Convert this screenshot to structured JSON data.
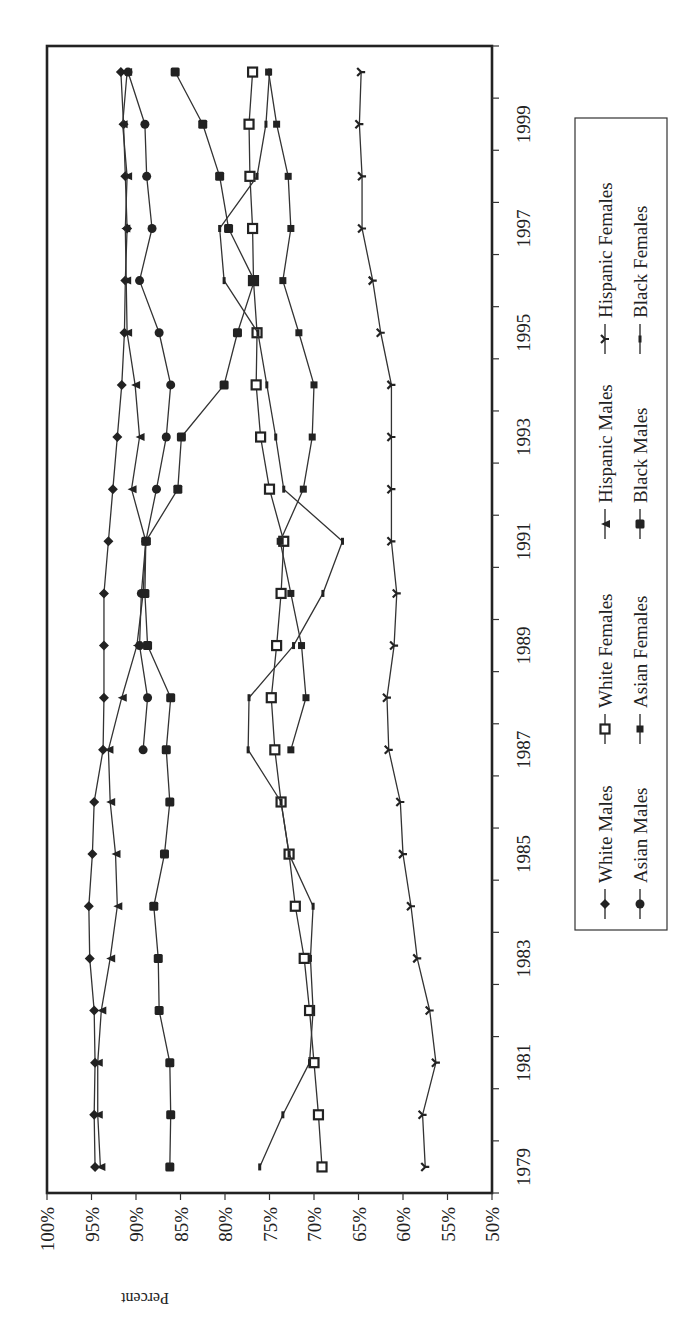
{
  "chart_data": {
    "type": "line",
    "orientation": "rotated-90-clockwise",
    "title": "",
    "xlabel": "",
    "ylabel": "Percent",
    "ylim": [
      50,
      100
    ],
    "y_ticks": [
      "100%",
      "95%",
      "90%",
      "85%",
      "80%",
      "75%",
      "70%",
      "65%",
      "60%",
      "55%",
      "50%"
    ],
    "x_tick_labels": [
      "1979",
      "1981",
      "1983",
      "1985",
      "1987",
      "1989",
      "1991",
      "1993",
      "1995",
      "1997",
      "1999"
    ],
    "categories": [
      "1979",
      "1980",
      "1981",
      "1982",
      "1983",
      "1984",
      "1985",
      "1986",
      "1987",
      "1988",
      "1989",
      "1990",
      "1991",
      "1992",
      "1993",
      "1994",
      "1995",
      "1996",
      "1997",
      "1998",
      "1999",
      "2000"
    ],
    "grid": false,
    "legend_position": "right (below plot when rotated back)",
    "series": [
      {
        "name": "White Males",
        "marker": "diamond",
        "values": [
          94.6,
          94.7,
          94.6,
          94.7,
          95.2,
          95.3,
          94.9,
          94.7,
          93.7,
          93.6,
          93.6,
          93.6,
          93.1,
          92.6,
          92.1,
          91.6,
          91.3,
          91.2,
          91.0,
          91.2,
          91.4,
          91.7
        ]
      },
      {
        "name": "White Females",
        "marker": "open-square",
        "values": [
          69.1,
          69.5,
          70.0,
          70.5,
          71.1,
          72.1,
          72.8,
          73.7,
          74.4,
          74.8,
          74.2,
          73.7,
          73.4,
          75.0,
          76.0,
          76.5,
          76.4,
          76.8,
          76.9,
          77.2,
          77.3,
          76.9
        ]
      },
      {
        "name": "Hispanic Males",
        "marker": "filled-triangle",
        "values": [
          94.0,
          94.3,
          94.3,
          93.9,
          92.9,
          92.1,
          92.3,
          92.9,
          93.1,
          91.6,
          89.9,
          89.2,
          88.9,
          90.5,
          89.6,
          90.1,
          91.0,
          91.1,
          91.2,
          91.0,
          91.5,
          91.0
        ]
      },
      {
        "name": "Hispanic Females",
        "marker": "cross-arrow",
        "values": [
          57.5,
          57.8,
          56.3,
          57.0,
          58.4,
          59.1,
          60.0,
          60.3,
          61.6,
          61.8,
          61.0,
          60.7,
          61.3,
          61.3,
          61.3,
          61.3,
          62.5,
          63.4,
          64.6,
          64.6,
          64.9,
          64.7
        ]
      },
      {
        "name": "Asian Males",
        "marker": "filled-circle",
        "values": [
          null,
          null,
          null,
          null,
          null,
          null,
          null,
          null,
          89.2,
          88.7,
          89.6,
          89.4,
          88.9,
          87.7,
          86.6,
          86.1,
          87.4,
          89.6,
          88.2,
          88.8,
          89.0,
          90.9
        ]
      },
      {
        "name": "Asian Females",
        "marker": "small-square",
        "values": [
          null,
          null,
          null,
          null,
          null,
          null,
          null,
          null,
          72.6,
          70.9,
          71.4,
          72.6,
          73.8,
          71.2,
          70.2,
          70.0,
          71.7,
          73.5,
          72.6,
          72.9,
          74.2,
          75.1
        ]
      },
      {
        "name": "Black Males",
        "marker": "filled-square",
        "values": [
          86.2,
          86.1,
          86.2,
          87.4,
          87.5,
          88.0,
          86.8,
          86.2,
          86.6,
          86.1,
          88.7,
          89.0,
          88.9,
          85.3,
          84.9,
          80.1,
          78.6,
          76.7,
          79.6,
          80.6,
          82.5,
          85.6
        ]
      },
      {
        "name": "Black Females",
        "marker": "small-tick",
        "values": [
          76.1,
          73.5,
          70.5,
          70.1,
          70.4,
          70.1,
          72.8,
          73.7,
          77.4,
          77.3,
          72.3,
          69.0,
          66.8,
          73.4,
          74.3,
          75.3,
          76.3,
          80.1,
          80.6,
          76.4,
          75.4,
          75.0
        ]
      }
    ]
  },
  "axis": {
    "percent_label": "Percent",
    "percent_ticks": [
      "100%",
      "95%",
      "90%",
      "85%",
      "80%",
      "75%",
      "70%",
      "65%",
      "60%",
      "55%",
      "50%"
    ],
    "year_ticks": [
      "1979",
      "1981",
      "1983",
      "1985",
      "1987",
      "1989",
      "1991",
      "1993",
      "1995",
      "1997",
      "1999"
    ]
  },
  "legend": {
    "items": [
      {
        "label": "White Males"
      },
      {
        "label": "White Females"
      },
      {
        "label": "Hispanic Males"
      },
      {
        "label": "Hispanic Females"
      },
      {
        "label": "Asian Males"
      },
      {
        "label": "Asian Females"
      },
      {
        "label": "Black Males"
      },
      {
        "label": "Black Females"
      }
    ]
  },
  "colors": {
    "ink": "#222222",
    "background": "#ffffff"
  }
}
